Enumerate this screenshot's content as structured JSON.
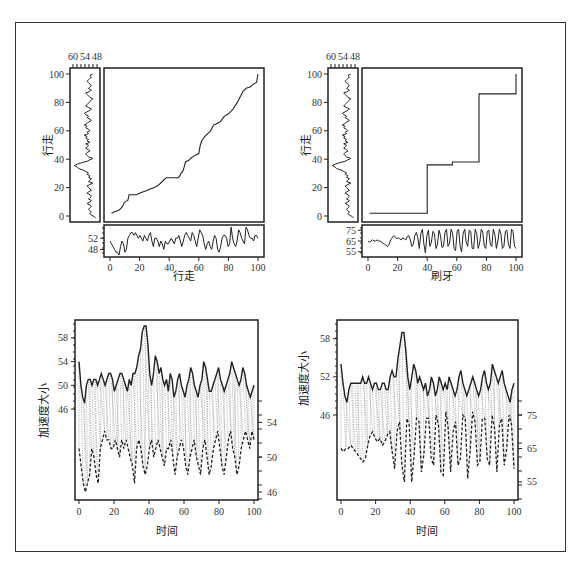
{
  "chart_data": [
    {
      "id": "top-left",
      "type": "line",
      "panel": "recurrence-alignment",
      "main": {
        "xlabel": "行走",
        "ylabel": "行走",
        "x_ticks": [
          0,
          20,
          40,
          60,
          80,
          100
        ],
        "y_ticks": [
          0,
          20,
          40,
          60,
          80,
          100
        ],
        "xlim": [
          0,
          100
        ],
        "ylim": [
          0,
          100
        ],
        "path": [
          [
            1,
            2
          ],
          [
            3,
            3
          ],
          [
            6,
            4
          ],
          [
            8,
            6
          ],
          [
            10,
            10
          ],
          [
            12,
            11
          ],
          [
            13,
            15
          ],
          [
            18,
            15
          ],
          [
            20,
            16
          ],
          [
            22,
            17
          ],
          [
            25,
            18
          ],
          [
            27,
            19
          ],
          [
            30,
            20
          ],
          [
            33,
            22
          ],
          [
            36,
            25
          ],
          [
            38,
            27
          ],
          [
            46,
            27
          ],
          [
            47,
            28
          ],
          [
            48,
            30
          ],
          [
            49,
            31
          ],
          [
            50,
            34
          ],
          [
            51,
            38
          ],
          [
            53,
            39
          ],
          [
            55,
            41
          ],
          [
            58,
            43
          ],
          [
            60,
            44
          ],
          [
            61,
            50
          ],
          [
            62,
            53
          ],
          [
            64,
            56
          ],
          [
            66,
            58
          ],
          [
            68,
            60
          ],
          [
            70,
            64
          ],
          [
            72,
            65
          ],
          [
            74,
            66
          ],
          [
            75,
            67
          ],
          [
            77,
            70
          ],
          [
            80,
            72
          ],
          [
            83,
            75
          ],
          [
            86,
            80
          ],
          [
            88,
            84
          ],
          [
            90,
            88
          ],
          [
            92,
            90
          ],
          [
            95,
            91
          ],
          [
            97,
            93
          ],
          [
            99,
            94
          ],
          [
            100,
            100
          ]
        ]
      },
      "side": {
        "top_ticks": [
          "60",
          "54",
          "48"
        ],
        "series": [
          46,
          47,
          49,
          50,
          49,
          50,
          51,
          50,
          49,
          50,
          52,
          50,
          49,
          51,
          50,
          49,
          50,
          52,
          51,
          49,
          50,
          51,
          52,
          50,
          48,
          51,
          50,
          49,
          51,
          50,
          52,
          51,
          53,
          55,
          58,
          59,
          61,
          59,
          56,
          52,
          50,
          48,
          51,
          52,
          53,
          52,
          50,
          51,
          53,
          52,
          51,
          53,
          50,
          52,
          51,
          53,
          52,
          54,
          51,
          52,
          50,
          51,
          53,
          52,
          54,
          52,
          51,
          49,
          50,
          52,
          51,
          53,
          54,
          52,
          50,
          49,
          51,
          53,
          52,
          51,
          50,
          49,
          48,
          50,
          51,
          52,
          53,
          50,
          49,
          51,
          50,
          49,
          50,
          51,
          52,
          51,
          50,
          49,
          50,
          48
        ]
      },
      "bottom": {
        "y_ticks": [
          48,
          52
        ],
        "ylim": [
          46,
          56
        ],
        "series": [
          51,
          50,
          49,
          48,
          47,
          47,
          46,
          49,
          51,
          50,
          47,
          48,
          52,
          53,
          54,
          54,
          53,
          54,
          53,
          52,
          53,
          52,
          51,
          53,
          52,
          51,
          53,
          54,
          51,
          49,
          52,
          52,
          51,
          49,
          51,
          50,
          48,
          51,
          50,
          50,
          51,
          52,
          51,
          50,
          52,
          52,
          53,
          51,
          49,
          51,
          53,
          54,
          53,
          52,
          51,
          54,
          53,
          51,
          49,
          52,
          55,
          54,
          53,
          50,
          48,
          50,
          51,
          49,
          48,
          51,
          53,
          52,
          48,
          47,
          49,
          52,
          53,
          53,
          52,
          49,
          50,
          56,
          52,
          50,
          49,
          51,
          55,
          54,
          52,
          51,
          50,
          56,
          55,
          53,
          52,
          52,
          51,
          53,
          53,
          52
        ]
      }
    },
    {
      "id": "top-right",
      "type": "line",
      "panel": "recurrence-alignment",
      "main": {
        "xlabel": "刷牙",
        "ylabel": "行走",
        "x_ticks": [
          0,
          20,
          40,
          60,
          80,
          100
        ],
        "y_ticks": [
          0,
          20,
          40,
          60,
          80,
          100
        ],
        "xlim": [
          0,
          100
        ],
        "ylim": [
          0,
          100
        ],
        "path": [
          [
            1,
            2
          ],
          [
            40,
            2
          ],
          [
            40,
            36
          ],
          [
            57,
            36
          ],
          [
            57,
            38
          ],
          [
            75,
            38
          ],
          [
            75,
            86
          ],
          [
            100,
            86
          ],
          [
            100,
            100
          ]
        ]
      },
      "side": {
        "top_ticks": [
          "60",
          "54",
          "48"
        ],
        "series": "same-as-top-left"
      },
      "bottom": {
        "y_ticks": [
          55,
          65,
          75
        ],
        "ylim": [
          52,
          78
        ],
        "series": [
          65,
          64,
          65,
          66,
          65,
          65,
          66,
          65,
          65,
          64,
          63,
          62,
          61,
          60,
          62,
          66,
          68,
          70,
          69,
          67,
          68,
          67,
          66,
          68,
          67,
          66,
          69,
          70,
          66,
          60,
          62,
          70,
          73,
          68,
          58,
          72,
          76,
          62,
          54,
          70,
          75,
          60,
          64,
          74,
          72,
          58,
          62,
          75,
          70,
          59,
          60,
          73,
          76,
          60,
          63,
          76,
          72,
          58,
          56,
          74,
          76,
          60,
          55,
          72,
          76,
          64,
          60,
          75,
          74,
          58,
          58,
          76,
          72,
          58,
          64,
          76,
          73,
          60,
          58,
          74,
          75,
          62,
          60,
          76,
          71,
          58,
          65,
          76,
          72,
          58,
          60,
          74,
          75,
          62,
          58,
          76,
          74,
          60,
          58
        ]
      }
    },
    {
      "id": "bottom-left",
      "type": "line",
      "panel": "aligned-series",
      "xlabel": "时间",
      "ylabel": "加速度大小",
      "x_ticks": [
        0,
        20,
        40,
        60,
        80,
        100
      ],
      "left_ticks": [
        46,
        50,
        54,
        58
      ],
      "right_ticks": [
        46,
        50,
        54
      ],
      "series": [
        {
          "name": "top (solid)",
          "values": [
            54,
            50,
            48,
            47,
            50,
            51,
            51,
            50,
            51,
            51,
            50,
            51,
            52,
            51,
            50,
            51,
            52,
            52,
            51,
            49,
            50,
            51,
            52,
            52,
            51,
            50,
            49,
            51,
            50,
            52,
            52,
            53,
            55,
            56,
            59,
            60,
            60,
            57,
            52,
            50,
            52,
            55,
            54,
            52,
            53,
            51,
            50,
            51,
            49,
            52,
            51,
            48,
            49,
            51,
            52,
            50,
            49,
            48,
            50,
            51,
            53,
            52,
            50,
            49,
            48,
            50,
            51,
            54,
            53,
            51,
            49,
            49,
            50,
            51,
            52,
            53,
            51,
            50,
            49,
            50,
            51,
            52,
            54,
            53,
            52,
            51,
            50,
            51,
            53,
            52,
            50,
            49,
            48,
            49,
            50
          ]
        },
        {
          "name": "bottom (dashed)",
          "values": [
            51,
            49,
            47,
            46,
            47,
            48,
            51,
            50,
            48,
            47,
            51,
            52,
            53,
            52,
            52,
            51,
            51,
            52,
            51,
            50,
            52,
            51,
            52,
            51,
            50,
            49,
            47,
            51,
            52,
            51,
            49,
            48,
            49,
            51,
            52,
            50,
            51,
            52,
            51,
            50,
            49,
            51,
            51,
            52,
            50,
            48,
            50,
            51,
            52,
            51,
            49,
            48,
            50,
            51,
            52,
            50,
            49,
            48,
            51,
            52,
            50,
            48,
            49,
            51,
            52,
            53,
            51,
            49,
            48,
            50,
            52,
            53,
            51,
            50,
            48,
            49,
            51,
            52,
            53,
            52,
            51,
            53,
            52
          ]
        }
      ]
    },
    {
      "id": "bottom-right",
      "type": "line",
      "panel": "aligned-series",
      "xlabel": "时间",
      "ylabel": "加速度大小",
      "x_ticks": [
        0,
        20,
        40,
        60,
        80,
        100
      ],
      "left_ticks": [
        46,
        52,
        58
      ],
      "right_ticks": [
        55,
        65,
        75
      ],
      "series": [
        {
          "name": "top (solid)",
          "values": [
            54,
            51,
            49,
            48,
            50,
            51,
            51,
            51,
            51,
            51,
            51,
            52,
            51,
            51,
            52,
            51,
            50,
            51,
            51,
            50,
            50,
            51,
            51,
            50,
            50,
            52,
            53,
            52,
            52,
            55,
            57,
            59,
            59,
            56,
            52,
            50,
            52,
            54,
            53,
            51,
            52,
            51,
            50,
            51,
            49,
            50,
            52,
            51,
            49,
            50,
            52,
            51,
            50,
            51,
            50,
            52,
            51,
            50,
            49,
            50,
            52,
            53,
            51,
            50,
            49,
            50,
            51,
            52,
            51,
            50,
            49,
            50,
            52,
            53,
            51,
            50,
            51,
            54,
            53,
            52,
            51,
            52,
            53,
            51,
            50,
            49,
            48,
            50,
            51
          ]
        },
        {
          "name": "bottom (dashed)",
          "values": [
            65,
            64,
            65,
            65,
            66,
            65,
            64,
            63,
            62,
            61,
            62,
            66,
            69,
            70,
            68,
            67,
            68,
            66,
            67,
            69,
            70,
            64,
            59,
            70,
            73,
            60,
            55,
            74,
            72,
            55,
            63,
            74,
            73,
            58,
            63,
            74,
            74,
            62,
            60,
            75,
            72,
            58,
            57,
            76,
            71,
            58,
            70,
            73,
            60,
            62,
            75,
            74,
            56,
            64,
            76,
            73,
            60,
            61,
            74,
            74,
            62,
            60,
            75,
            71,
            58,
            72,
            74,
            60,
            65,
            75,
            72,
            59
          ]
        }
      ]
    }
  ],
  "labels": {
    "tl_xlabel": "行走",
    "tl_ylabel": "行走",
    "tr_xlabel": "刷牙",
    "tr_ylabel": "行走",
    "bl_xlabel": "时间",
    "bl_ylabel": "加速度大小",
    "br_xlabel": "时间",
    "br_ylabel": "加速度大小"
  }
}
